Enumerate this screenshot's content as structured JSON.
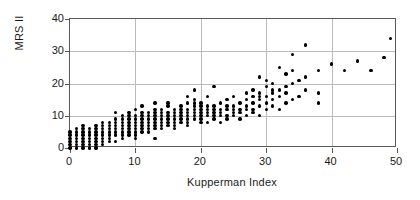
{
  "chart_data": {
    "type": "scatter",
    "title": "",
    "xlabel": "Kupperman Index",
    "ylabel": "MRS II",
    "xlim": [
      0,
      50
    ],
    "ylim": [
      0,
      40
    ],
    "xticks": [
      0,
      10,
      20,
      30,
      40,
      50
    ],
    "yticks": [
      0,
      10,
      20,
      30,
      40
    ],
    "grid": true,
    "legend": null,
    "marker": "filled-circle",
    "marker_color": "#000000",
    "points": [
      [
        0,
        0
      ],
      [
        0,
        1
      ],
      [
        0,
        2
      ],
      [
        0,
        3
      ],
      [
        0,
        4
      ],
      [
        0,
        5
      ],
      [
        1,
        0
      ],
      [
        1,
        1
      ],
      [
        1,
        2
      ],
      [
        1,
        3
      ],
      [
        1,
        4
      ],
      [
        1,
        5
      ],
      [
        1,
        6
      ],
      [
        2,
        0
      ],
      [
        2,
        1
      ],
      [
        2,
        2
      ],
      [
        2,
        3
      ],
      [
        2,
        4
      ],
      [
        2,
        5
      ],
      [
        2,
        6
      ],
      [
        2,
        7
      ],
      [
        3,
        0
      ],
      [
        3,
        1
      ],
      [
        3,
        2
      ],
      [
        3,
        3
      ],
      [
        3,
        4
      ],
      [
        3,
        5
      ],
      [
        3,
        6
      ],
      [
        4,
        0
      ],
      [
        4,
        1
      ],
      [
        4,
        2
      ],
      [
        4,
        3
      ],
      [
        4,
        4
      ],
      [
        4,
        5
      ],
      [
        4,
        6
      ],
      [
        4,
        7
      ],
      [
        5,
        1
      ],
      [
        5,
        2
      ],
      [
        5,
        3
      ],
      [
        5,
        4
      ],
      [
        5,
        5
      ],
      [
        5,
        6
      ],
      [
        5,
        7
      ],
      [
        5,
        8
      ],
      [
        6,
        2
      ],
      [
        6,
        3
      ],
      [
        6,
        4
      ],
      [
        6,
        5
      ],
      [
        6,
        6
      ],
      [
        6,
        7
      ],
      [
        6,
        8
      ],
      [
        7,
        2
      ],
      [
        7,
        4
      ],
      [
        7,
        5
      ],
      [
        7,
        6
      ],
      [
        7,
        7
      ],
      [
        7,
        8
      ],
      [
        7,
        9
      ],
      [
        7,
        11
      ],
      [
        8,
        3
      ],
      [
        8,
        4
      ],
      [
        8,
        5
      ],
      [
        8,
        6
      ],
      [
        8,
        7
      ],
      [
        8,
        8
      ],
      [
        8,
        9
      ],
      [
        8,
        10
      ],
      [
        9,
        4
      ],
      [
        9,
        5
      ],
      [
        9,
        6
      ],
      [
        9,
        7
      ],
      [
        9,
        8
      ],
      [
        9,
        9
      ],
      [
        9,
        10
      ],
      [
        9,
        11
      ],
      [
        10,
        3
      ],
      [
        10,
        4
      ],
      [
        10,
        5
      ],
      [
        10,
        6
      ],
      [
        10,
        7
      ],
      [
        10,
        8
      ],
      [
        10,
        9
      ],
      [
        10,
        10
      ],
      [
        10,
        12
      ],
      [
        11,
        5
      ],
      [
        11,
        6
      ],
      [
        11,
        7
      ],
      [
        11,
        8
      ],
      [
        11,
        9
      ],
      [
        11,
        10
      ],
      [
        11,
        11
      ],
      [
        11,
        13
      ],
      [
        12,
        5
      ],
      [
        12,
        6
      ],
      [
        12,
        7
      ],
      [
        12,
        8
      ],
      [
        12,
        9
      ],
      [
        12,
        10
      ],
      [
        12,
        11
      ],
      [
        13,
        3
      ],
      [
        13,
        6
      ],
      [
        13,
        7
      ],
      [
        13,
        8
      ],
      [
        13,
        9
      ],
      [
        13,
        10
      ],
      [
        13,
        11
      ],
      [
        13,
        12
      ],
      [
        13,
        14
      ],
      [
        14,
        6
      ],
      [
        14,
        7
      ],
      [
        14,
        8
      ],
      [
        14,
        9
      ],
      [
        14,
        10
      ],
      [
        14,
        11
      ],
      [
        14,
        12
      ],
      [
        15,
        7
      ],
      [
        15,
        8
      ],
      [
        15,
        9
      ],
      [
        15,
        10
      ],
      [
        15,
        11
      ],
      [
        15,
        13
      ],
      [
        15,
        14
      ],
      [
        16,
        6
      ],
      [
        16,
        7
      ],
      [
        16,
        8
      ],
      [
        16,
        9
      ],
      [
        16,
        10
      ],
      [
        16,
        11
      ],
      [
        16,
        12
      ],
      [
        17,
        8
      ],
      [
        17,
        9
      ],
      [
        17,
        10
      ],
      [
        17,
        11
      ],
      [
        17,
        12
      ],
      [
        17,
        13
      ],
      [
        18,
        7
      ],
      [
        18,
        8
      ],
      [
        18,
        9
      ],
      [
        18,
        10
      ],
      [
        18,
        11
      ],
      [
        18,
        12
      ],
      [
        18,
        14
      ],
      [
        18,
        16
      ],
      [
        19,
        9
      ],
      [
        19,
        10
      ],
      [
        19,
        11
      ],
      [
        19,
        12
      ],
      [
        19,
        13
      ],
      [
        19,
        14
      ],
      [
        19,
        15
      ],
      [
        19,
        18
      ],
      [
        20,
        8
      ],
      [
        20,
        9
      ],
      [
        20,
        10
      ],
      [
        20,
        11
      ],
      [
        20,
        12
      ],
      [
        20,
        13
      ],
      [
        20,
        14
      ],
      [
        21,
        8
      ],
      [
        21,
        10
      ],
      [
        21,
        11
      ],
      [
        21,
        12
      ],
      [
        21,
        13
      ],
      [
        21,
        16
      ],
      [
        22,
        9
      ],
      [
        22,
        10
      ],
      [
        22,
        11
      ],
      [
        22,
        12
      ],
      [
        22,
        13
      ],
      [
        22,
        19
      ],
      [
        23,
        8
      ],
      [
        23,
        10
      ],
      [
        23,
        11
      ],
      [
        23,
        12
      ],
      [
        23,
        14
      ],
      [
        24,
        9
      ],
      [
        24,
        10
      ],
      [
        24,
        12
      ],
      [
        24,
        13
      ],
      [
        24,
        15
      ],
      [
        25,
        10
      ],
      [
        25,
        11
      ],
      [
        25,
        12
      ],
      [
        25,
        13
      ],
      [
        25,
        16
      ],
      [
        26,
        9
      ],
      [
        26,
        11
      ],
      [
        26,
        12
      ],
      [
        26,
        14
      ],
      [
        27,
        10
      ],
      [
        27,
        12
      ],
      [
        27,
        13
      ],
      [
        27,
        15
      ],
      [
        27,
        17
      ],
      [
        28,
        11
      ],
      [
        28,
        12
      ],
      [
        28,
        14
      ],
      [
        28,
        16
      ],
      [
        28,
        18
      ],
      [
        29,
        10
      ],
      [
        29,
        13
      ],
      [
        29,
        15
      ],
      [
        29,
        16
      ],
      [
        29,
        17
      ],
      [
        29,
        22
      ],
      [
        30,
        12
      ],
      [
        30,
        14
      ],
      [
        30,
        16
      ],
      [
        30,
        19
      ],
      [
        30,
        21
      ],
      [
        31,
        13
      ],
      [
        31,
        15
      ],
      [
        31,
        17
      ],
      [
        31,
        18
      ],
      [
        31,
        20
      ],
      [
        32,
        12
      ],
      [
        32,
        16
      ],
      [
        32,
        18
      ],
      [
        32,
        25
      ],
      [
        33,
        14
      ],
      [
        33,
        17
      ],
      [
        33,
        19
      ],
      [
        33,
        23
      ],
      [
        34,
        15
      ],
      [
        34,
        20
      ],
      [
        34,
        24
      ],
      [
        34,
        29
      ],
      [
        35,
        16
      ],
      [
        35,
        21
      ],
      [
        36,
        18
      ],
      [
        36,
        22
      ],
      [
        36,
        32
      ],
      [
        38,
        14
      ],
      [
        38,
        17
      ],
      [
        38,
        24
      ],
      [
        40,
        26
      ],
      [
        42,
        24
      ],
      [
        44,
        27
      ],
      [
        46,
        24
      ],
      [
        48,
        28
      ],
      [
        49,
        34
      ]
    ]
  },
  "axes": {
    "y_tick_labels": [
      "0",
      "10",
      "20",
      "30",
      "40"
    ],
    "x_tick_labels": [
      "0",
      "10",
      "20",
      "30",
      "40",
      "50"
    ]
  },
  "colors": {
    "marker": "#000000",
    "grid": "#b9bcbf",
    "frame": "#55585c",
    "text": "#1a1a1a",
    "background": "#ffffff"
  }
}
